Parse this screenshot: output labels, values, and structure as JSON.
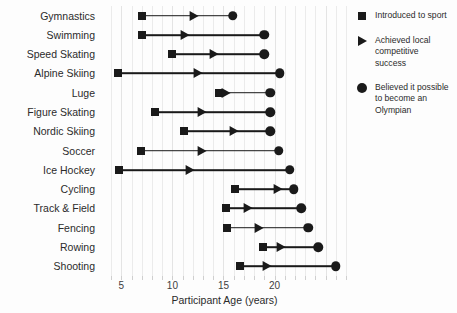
{
  "chart_data": {
    "type": "scatter",
    "title": "",
    "xlabel": "Participant Age (years)",
    "ylabel": "",
    "xlim": [
      3.2,
      27.0
    ],
    "xticks": [
      5,
      10,
      15,
      20
    ],
    "xtick_labels": [
      "5",
      "10",
      "15",
      "20"
    ],
    "grid": true,
    "grid_axis": "x",
    "grid_step": 1,
    "legend_position": "right",
    "marker_color": "#1a1a1a",
    "series": [
      {
        "name": "Introduced to sport",
        "marker": "square"
      },
      {
        "name": "Achieved local competitive success",
        "marker": "triangle"
      },
      {
        "name": "Believed it possible to become an Olympian",
        "marker": "circle"
      }
    ],
    "categories": [
      "Gymnastics",
      "Swimming",
      "Speed Skating",
      "Alpine Skiing",
      "Luge",
      "Figure Skating",
      "Nordic Skiing",
      "Soccer",
      "Ice Hockey",
      "Cycling",
      "Track & Field",
      "Fencing",
      "Rowing",
      "Shooting"
    ],
    "rows": [
      {
        "label": "Gymnastics",
        "introduced": 7.0,
        "local_success": 12.2,
        "olympian_belief": 15.9
      },
      {
        "label": "Swimming",
        "introduced": 7.0,
        "local_success": 11.3,
        "olympian_belief": 19.0
      },
      {
        "label": "Speed Skating",
        "introduced": 10.0,
        "local_success": 14.2,
        "olympian_belief": 19.0
      },
      {
        "label": "Alpine Skiing",
        "introduced": 4.7,
        "local_success": 12.6,
        "olympian_belief": 20.5
      },
      {
        "label": "Luge",
        "introduced": 14.6,
        "local_success": 15.3,
        "olympian_belief": 19.6
      },
      {
        "label": "Figure Skating",
        "introduced": 8.3,
        "local_success": 13.0,
        "olympian_belief": 19.6
      },
      {
        "label": "Nordic Skiing",
        "introduced": 11.1,
        "local_success": 16.1,
        "olympian_belief": 19.6
      },
      {
        "label": "Soccer",
        "introduced": 6.9,
        "local_success": 13.0,
        "olympian_belief": 20.4
      },
      {
        "label": "Ice Hockey",
        "introduced": 4.8,
        "local_success": 11.8,
        "olympian_belief": 21.5
      },
      {
        "label": "Cycling",
        "introduced": 16.1,
        "local_success": 20.4,
        "olympian_belief": 21.9
      },
      {
        "label": "Track & Field",
        "introduced": 15.2,
        "local_success": 17.5,
        "olympian_belief": 22.6
      },
      {
        "label": "Fencing",
        "introduced": 15.3,
        "local_success": 18.6,
        "olympian_belief": 23.3
      },
      {
        "label": "Rowing",
        "introduced": 18.9,
        "local_success": 20.7,
        "olympian_belief": 24.3
      },
      {
        "label": "Shooting",
        "introduced": 16.6,
        "local_success": 19.4,
        "olympian_belief": 26.0
      }
    ]
  },
  "legend": {
    "items": [
      {
        "glyph": "square-marker",
        "label": "Introduced to sport"
      },
      {
        "glyph": "triangle-marker",
        "label": "Achieved local competitive success"
      },
      {
        "glyph": "circle-marker",
        "label": "Believed it possible to become an Olympian"
      }
    ]
  }
}
